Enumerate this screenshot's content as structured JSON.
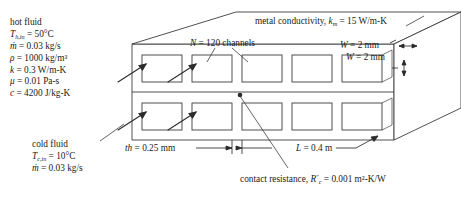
{
  "figure": {
    "type": "technical-diagram",
    "hot_fluid": {
      "heading": "hot fluid",
      "lines": [
        {
          "sym": "T",
          "sub": "h,in",
          "rest": " = 50°C"
        },
        {
          "sym": "ṁ",
          "sub": "",
          "rest": " = 0.03 kg/s"
        },
        {
          "sym": "ρ",
          "sub": "",
          "rest": " = 1000 kg/m³"
        },
        {
          "sym": "k",
          "sub": "",
          "rest": " = 0.3 W/m-K"
        },
        {
          "sym": "μ",
          "sub": "",
          "rest": " = 0.01 Pa-s"
        },
        {
          "sym": "c",
          "sub": "",
          "rest": " = 4200 J/kg-K"
        }
      ]
    },
    "cold_fluid": {
      "heading": "cold fluid",
      "lines": [
        {
          "sym": "T",
          "sub": "c,in",
          "rest": " = 10°C"
        },
        {
          "sym": "ṁ",
          "sub": "",
          "rest": " = 0.03 kg/s"
        }
      ]
    },
    "callouts": {
      "channels": {
        "sym": "N",
        "rest": " = 120 channels"
      },
      "metal_conductivity": {
        "prefix": "metal conductivity, ",
        "sym": "k",
        "sub": "m",
        "rest": " = 15 W/m-K"
      },
      "width_top": {
        "sym": "W",
        "rest": " = 2 mm"
      },
      "width_bottom": {
        "sym": "W",
        "rest": " = 2 mm"
      },
      "thickness": {
        "sym": "th",
        "rest": " = 0.25 mm"
      },
      "length": {
        "sym": "L",
        "rest": " = 0.4 m"
      },
      "contact_resistance": {
        "prefix": "contact resistance, ",
        "sym": "R",
        "sub": "c",
        "sup": "″",
        "rest": " = 0.001 m²-K/W"
      }
    },
    "geometry": {
      "channel_count_drawn_per_row": 5,
      "rows": 2,
      "flow_arrows": 4
    },
    "colors": {
      "line": "#3c3c3c",
      "fill": "#ffffff",
      "text": "#1a1a1a"
    }
  }
}
